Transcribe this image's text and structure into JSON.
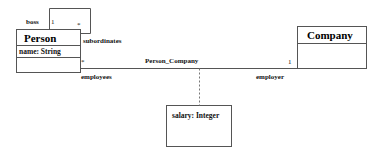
{
  "diagram": {
    "type": "uml-class-diagram",
    "background": "#ffffff",
    "line_color": "#555555",
    "text_color": "#111111"
  },
  "classes": {
    "person": {
      "name": "Person",
      "attribute": "name: String"
    },
    "company": {
      "name": "Company"
    },
    "association_class": {
      "attribute": "salary: Integer"
    }
  },
  "associations": {
    "self": {
      "role_boss": "boss",
      "mult_boss": "1",
      "mult_subordinates": "*",
      "role_subordinates": "subordinates"
    },
    "person_company": {
      "name": "Person_Company",
      "mult_employees": "*",
      "role_employees": "employees",
      "mult_employer": "1",
      "role_employer": "employer"
    }
  }
}
